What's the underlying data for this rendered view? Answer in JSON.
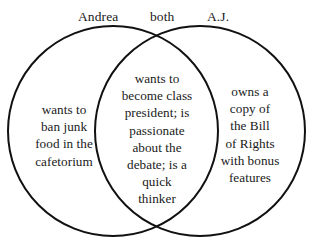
{
  "diagram": {
    "type": "venn",
    "title": "",
    "background_color": "#ffffff",
    "stroke_color": "#111111",
    "text_color": "#1a1a1a",
    "headers": {
      "left": "Andrea",
      "center": "both",
      "right": "A.J."
    },
    "regions": {
      "left_only": {
        "label": "Andrea",
        "text": "wants to ban junk food in the cafetorium",
        "lines": [
          "wants to",
          "ban junk",
          "food in the",
          "cafetorium"
        ]
      },
      "intersection": {
        "label": "both",
        "text": "wants to become class president; is passionate about the debate; is a quick thinker",
        "lines": [
          "wants to",
          "become class",
          "president; is",
          "passionate",
          "about the",
          "debate; is a",
          "quick",
          "thinker"
        ]
      },
      "right_only": {
        "label": "A.J.",
        "text": "owns a copy of the Bill of Rights with bonus features",
        "lines": [
          "owns a",
          "copy of",
          "the Bill",
          "of Rights",
          "with bonus",
          "features"
        ]
      }
    },
    "geometry": {
      "left_circle": {
        "cx": 113,
        "cy": 131,
        "r": 105
      },
      "right_circle": {
        "cx": 200,
        "cy": 131,
        "r": 105
      }
    }
  }
}
